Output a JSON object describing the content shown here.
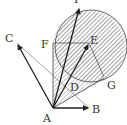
{
  "figure": {
    "type": "vector-geometry-diagram",
    "labels": {
      "A": "A",
      "B": "B",
      "C": "C",
      "D": "D",
      "E": "E",
      "F": "F",
      "G": "G",
      "P": "P"
    },
    "points": {
      "A": [
        53,
        108
      ],
      "B": [
        89,
        108
      ],
      "C": [
        17,
        43
      ],
      "D": [
        68,
        77
      ],
      "E": [
        89,
        43
      ],
      "F": [
        53,
        43
      ],
      "G": [
        104,
        77
      ],
      "P": [
        79,
        7
      ]
    },
    "circle": {
      "center": [
        91,
        46
      ],
      "radius": 36
    },
    "colors": {
      "stroke": "#222222",
      "hatch": "#555555",
      "thin": "#666666"
    }
  }
}
